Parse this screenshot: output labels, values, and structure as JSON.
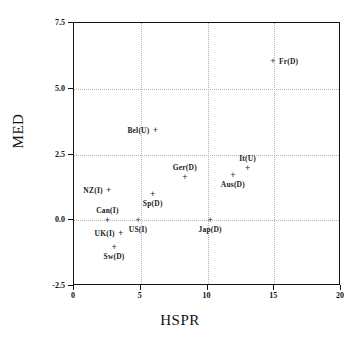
{
  "chart_data": {
    "type": "scatter",
    "title": "",
    "xlabel": "HSPR",
    "ylabel": "MED",
    "xlim": [
      0,
      20
    ],
    "ylim": [
      -2.5,
      7.5
    ],
    "xticks": [
      "0",
      "5",
      "10",
      "15",
      "20"
    ],
    "xtick_values": [
      0,
      5,
      10,
      15,
      20
    ],
    "yticks": [
      "7.5",
      "5.0",
      "2.5",
      "0.0",
      "-2.5"
    ],
    "ytick_values": [
      7.5,
      5.0,
      2.5,
      0.0,
      -2.5
    ],
    "grid": true,
    "grid_style": "dotted",
    "grid_color": "#b5b5b5",
    "marker": "plus",
    "marker_color": "#2b2b2b",
    "legend": "none",
    "points": [
      {
        "label": "Fr(D)",
        "x": 14.9,
        "y": 6.05,
        "label_pos": "right"
      },
      {
        "label": "Bel(U)",
        "x": 6.1,
        "y": 3.45,
        "label_pos": "left"
      },
      {
        "label": "It(U)",
        "x": 13.0,
        "y": 2.0,
        "label_pos": "above"
      },
      {
        "label": "Aus(D)",
        "x": 11.9,
        "y": 1.72,
        "label_pos": "below"
      },
      {
        "label": "Ger(D)",
        "x": 8.3,
        "y": 1.65,
        "label_pos": "above"
      },
      {
        "label": "NZ(I)",
        "x": 2.6,
        "y": 1.15,
        "label_pos": "left"
      },
      {
        "label": "Sp(D)",
        "x": 5.9,
        "y": 1.0,
        "label_pos": "below"
      },
      {
        "label": "Can(I)",
        "x": 2.5,
        "y": 0.0,
        "label_pos": "above"
      },
      {
        "label": "US(I)",
        "x": 4.8,
        "y": 0.0,
        "label_pos": "below"
      },
      {
        "label": "Jap(D)",
        "x": 10.2,
        "y": 0.0,
        "label_pos": "below"
      },
      {
        "label": "UK(I)",
        "x": 3.5,
        "y": -0.5,
        "label_pos": "left"
      },
      {
        "label": "Sw(D)",
        "x": 3.0,
        "y": -1.0,
        "label_pos": "below"
      }
    ],
    "marker_glyph": "+"
  }
}
